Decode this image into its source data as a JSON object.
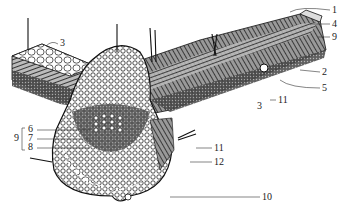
{
  "figure": {
    "colors": {
      "ink": "#1e1e1e",
      "paper": "#ffffff",
      "shade": "#555555"
    },
    "labels": [
      {
        "id": "1",
        "text": "1",
        "x": 332,
        "y": 5
      },
      {
        "id": "4",
        "text": "4",
        "x": 332,
        "y": 19
      },
      {
        "id": "9r",
        "text": "9",
        "x": 332,
        "y": 32
      },
      {
        "id": "2",
        "text": "2",
        "x": 322,
        "y": 68
      },
      {
        "id": "5",
        "text": "5",
        "x": 322,
        "y": 84
      },
      {
        "id": "11a",
        "text": "11",
        "x": 278,
        "y": 95
      },
      {
        "id": "3a",
        "text": "3",
        "x": 60,
        "y": 40
      },
      {
        "id": "3b",
        "text": "3",
        "x": 257,
        "y": 101
      },
      {
        "id": "6",
        "text": "6",
        "x": 29,
        "y": 125
      },
      {
        "id": "7",
        "text": "7",
        "x": 29,
        "y": 134
      },
      {
        "id": "8",
        "text": "8",
        "x": 29,
        "y": 143
      },
      {
        "id": "9l",
        "text": "9",
        "x": 16,
        "y": 134
      },
      {
        "id": "11b",
        "text": "11",
        "x": 214,
        "y": 144
      },
      {
        "id": "12",
        "text": "12",
        "x": 214,
        "y": 157
      },
      {
        "id": "10",
        "text": "10",
        "x": 262,
        "y": 193
      }
    ]
  }
}
